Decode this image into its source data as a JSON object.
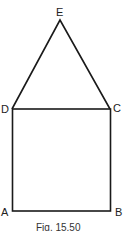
{
  "figure": {
    "caption": "Fig. 15.50",
    "points": {
      "E": {
        "label": "E",
        "x": 60,
        "y": 20
      },
      "D": {
        "label": "D",
        "x": 12,
        "y": 109
      },
      "C": {
        "label": "C",
        "x": 110,
        "y": 109
      },
      "A": {
        "label": "A",
        "x": 13,
        "y": 211
      },
      "B": {
        "label": "B",
        "x": 111,
        "y": 211
      }
    },
    "shapes": [
      {
        "type": "triangle",
        "vertices": [
          "D",
          "E",
          "C"
        ]
      },
      {
        "type": "square",
        "vertices": [
          "A",
          "B",
          "C",
          "D"
        ]
      }
    ],
    "stroke_color": "#1a1a1a"
  }
}
